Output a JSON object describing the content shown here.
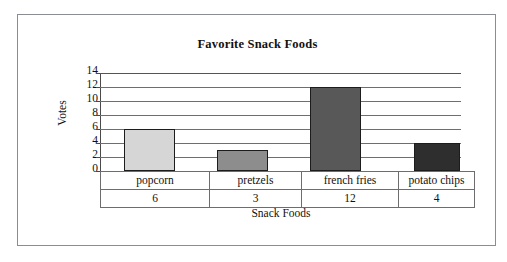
{
  "chart_data": {
    "type": "bar",
    "title": "Favorite Snack Foods",
    "xlabel": "Snack Foods",
    "ylabel": "Votes",
    "categories": [
      "popcorn",
      "pretzels",
      "french fries",
      "potato chips"
    ],
    "values": [
      6,
      3,
      12,
      4
    ],
    "ylim": [
      0,
      14
    ],
    "yticks": [
      14,
      12,
      10,
      8,
      6,
      4,
      2,
      0
    ],
    "ytick_labels": [
      "14",
      "12",
      "10",
      "8",
      "6",
      "4",
      "2",
      "0"
    ],
    "grid": true,
    "legend": "none",
    "bar_colors": [
      "#d6d6d6",
      "#8d8d8d",
      "#585858",
      "#2e2e2e"
    ],
    "bar_border_color": "#1c1c1c",
    "table": {
      "row_labels": [
        "popcorn",
        "pretzels",
        "french fries",
        "potato chips"
      ],
      "row_values": [
        "6",
        "3",
        "12",
        "4"
      ]
    }
  },
  "frame": {
    "border_color": "#8c8c93"
  }
}
